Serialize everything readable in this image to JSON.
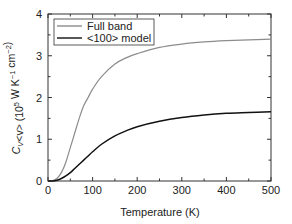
{
  "chart_data": {
    "type": "line",
    "title": "",
    "xlabel": "Temperature (K)",
    "ylabel": "C_V<v> (10^5 W K^-1 cm^-2)",
    "ylabel_parts": {
      "main": "C",
      "sub": "V",
      "rest": "<v> (10",
      "sup1": "5",
      "mid": " W K",
      "sup2": "−1",
      "mid2": " cm",
      "sup3": "−2",
      "end": ")"
    },
    "xlim": [
      0,
      500
    ],
    "ylim": [
      0,
      4
    ],
    "xticks": [
      0,
      100,
      200,
      300,
      400,
      500
    ],
    "yticks": [
      0,
      1,
      2,
      3,
      4
    ],
    "grid": false,
    "legend_position": "upper left",
    "x": [
      0,
      10,
      20,
      30,
      40,
      50,
      60,
      70,
      80,
      90,
      100,
      120,
      150,
      175,
      200,
      250,
      300,
      350,
      400,
      450,
      500
    ],
    "series": [
      {
        "name": "Full band",
        "color": "#8c8c8c",
        "values": [
          0,
          0.01,
          0.06,
          0.2,
          0.45,
          0.8,
          1.15,
          1.5,
          1.8,
          2.0,
          2.2,
          2.5,
          2.8,
          2.95,
          3.05,
          3.2,
          3.28,
          3.33,
          3.36,
          3.38,
          3.4
        ]
      },
      {
        "name": "<100> model",
        "color": "#111111",
        "values": [
          0,
          0.0,
          0.02,
          0.06,
          0.12,
          0.2,
          0.3,
          0.4,
          0.5,
          0.6,
          0.7,
          0.88,
          1.08,
          1.2,
          1.3,
          1.43,
          1.52,
          1.58,
          1.62,
          1.64,
          1.66
        ]
      }
    ]
  }
}
